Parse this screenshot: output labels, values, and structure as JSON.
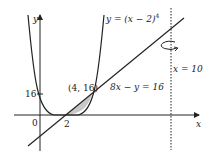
{
  "diagram": {
    "type": "math-graph",
    "axes": {
      "x_label": "x",
      "y_label": "y",
      "origin_label": "0"
    },
    "ticks": {
      "x_tick_label": "2",
      "y_tick_label": "16"
    },
    "curve": {
      "label": "y = (x − 2)",
      "exponent": "4"
    },
    "line": {
      "label": "8x − y = 16"
    },
    "intersection": {
      "label": "(4, 16)"
    },
    "axis_of_rotation": {
      "label": "x = 10"
    },
    "colors": {
      "stroke": "#222222",
      "shaded_region": "#c8c8c8"
    }
  }
}
